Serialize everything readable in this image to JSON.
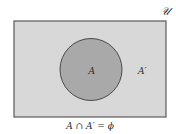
{
  "diagram": {
    "type": "venn",
    "universal_set_label": "𝒰",
    "set_label": "A",
    "complement_label": "A′",
    "caption": "A ∩ A′ = ϕ",
    "colors": {
      "universe_fill": "#d8d8d8",
      "set_fill": "#a9a9a9",
      "stroke": "#5a5a5a",
      "text": "#2a2a2a"
    }
  }
}
